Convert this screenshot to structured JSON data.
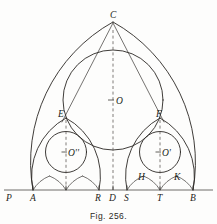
{
  "figure": {
    "caption": "Fig. 256.",
    "ink_color": "#2a2724",
    "paper_color": "#fdfdfc",
    "width": 217,
    "height": 224
  },
  "baseline": {
    "y": 190,
    "x_start": 4,
    "x_end": 213,
    "points": [
      {
        "id": "P",
        "label": "P",
        "x": 10,
        "tick": false
      },
      {
        "id": "A",
        "label": "A",
        "x": 33,
        "tick": true
      },
      {
        "id": "R",
        "label": "R",
        "x": 99,
        "tick": true
      },
      {
        "id": "D",
        "label": "D",
        "x": 113,
        "tick": true
      },
      {
        "id": "S",
        "label": "S",
        "x": 127,
        "tick": true
      },
      {
        "id": "T",
        "label": "T",
        "x": 160,
        "tick": true
      },
      {
        "id": "B",
        "label": "B",
        "x": 193,
        "tick": true
      }
    ],
    "extra_ticks": [
      66,
      160
    ]
  },
  "apex": {
    "label": "C",
    "x": 113,
    "y": 22
  },
  "centers": [
    {
      "id": "O",
      "label": "O",
      "x": 113,
      "y": 100,
      "r": 50,
      "mark": "cross"
    },
    {
      "id": "Odprime",
      "label": "O''",
      "x": 66,
      "y": 152,
      "r": 20.5,
      "mark": "cross"
    },
    {
      "id": "Oprime",
      "label": "O'",
      "x": 160,
      "y": 152,
      "r": 20.5,
      "mark": "cross"
    }
  ],
  "vertices": [
    {
      "id": "E",
      "label": "E",
      "x": 66,
      "y": 118
    },
    {
      "id": "F",
      "label": "F",
      "x": 160,
      "y": 118
    },
    {
      "id": "H",
      "label": "H",
      "x": 143,
      "y": 176
    },
    {
      "id": "K",
      "label": "K",
      "x": 177,
      "y": 176
    }
  ],
  "labels": {
    "C": "C",
    "O": "O",
    "O_prime": "O'",
    "O_double_prime": "O''",
    "E": "E",
    "F": "F",
    "H": "H",
    "K": "K",
    "P": "P",
    "A": "A",
    "R": "R",
    "D": "D",
    "S": "S",
    "T": "T",
    "B": "B"
  },
  "dashed_axes": [
    {
      "id": "axis-center",
      "x": 113,
      "y1": 30,
      "y2": 190
    },
    {
      "id": "axis-left",
      "x": 66,
      "y1": 120,
      "y2": 190
    },
    {
      "id": "axis-right",
      "x": 160,
      "y1": 120,
      "y2": 190
    }
  ]
}
